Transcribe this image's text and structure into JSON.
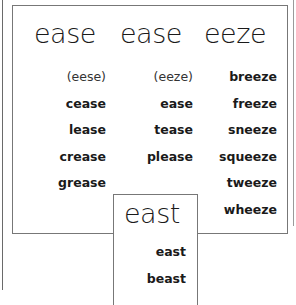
{
  "worksheet": {
    "columns": [
      {
        "header": "ease",
        "words": [
          "(eese)",
          "cease",
          "lease",
          "crease",
          "grease"
        ]
      },
      {
        "header": "ease",
        "words": [
          "(eeze)",
          "ease",
          "tease",
          "please"
        ]
      },
      {
        "header": "eeze",
        "words": [
          "breeze",
          "freeze",
          "sneeze",
          "squeeze",
          "tweeze",
          "wheeze"
        ]
      }
    ],
    "east_box": {
      "header": "east",
      "words": [
        "east",
        "beast"
      ]
    }
  }
}
